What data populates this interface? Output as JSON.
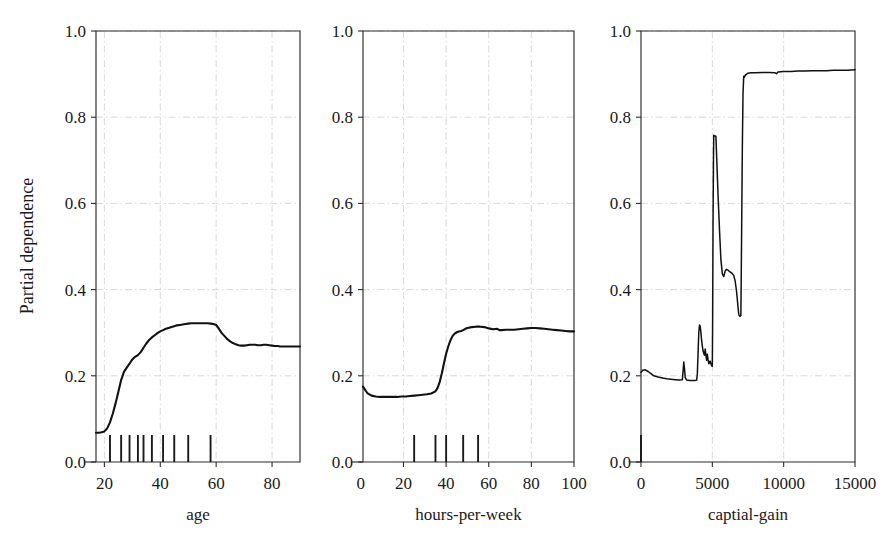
{
  "figure": {
    "ylabel": "Partial dependence",
    "background": "#ffffff",
    "line_color": "#111111",
    "grid_color": "#c8c8c8",
    "axis_color": "#2b2b2b"
  },
  "chart_data": [
    {
      "type": "line",
      "title": "",
      "xlabel": "age",
      "ylabel": "Partial dependence",
      "xlim": [
        17,
        90
      ],
      "ylim": [
        0.0,
        1.0
      ],
      "xticks": [
        20,
        40,
        60,
        80
      ],
      "yticks": [
        "0.0",
        "0.2",
        "0.4",
        "0.6",
        "0.8",
        "1.0"
      ],
      "ytick_values": [
        0.0,
        0.2,
        0.4,
        0.6,
        0.8,
        1.0
      ],
      "grid": true,
      "legend": "none",
      "rug_values": [
        22,
        26,
        29,
        32,
        34,
        37,
        41,
        45,
        50,
        58
      ],
      "x": [
        17,
        18,
        19,
        20,
        21,
        22,
        23,
        24,
        25,
        26,
        27,
        28,
        29,
        30,
        31,
        32,
        33,
        34,
        35,
        36,
        37,
        38,
        39,
        40,
        41,
        42,
        43,
        44,
        45,
        46,
        47,
        48,
        49,
        50,
        51,
        52,
        53,
        54,
        55,
        56,
        57,
        58,
        59,
        60,
        61,
        62,
        63,
        64,
        65,
        66,
        67,
        68,
        69,
        70,
        71,
        72,
        73,
        74,
        75,
        76,
        77,
        78,
        79,
        80,
        81,
        82,
        83,
        84,
        85,
        86,
        87,
        88,
        89,
        90
      ],
      "y": [
        0.068,
        0.068,
        0.069,
        0.071,
        0.078,
        0.092,
        0.112,
        0.136,
        0.163,
        0.19,
        0.209,
        0.219,
        0.228,
        0.238,
        0.244,
        0.248,
        0.255,
        0.265,
        0.275,
        0.283,
        0.289,
        0.294,
        0.299,
        0.303,
        0.306,
        0.309,
        0.311,
        0.313,
        0.315,
        0.317,
        0.318,
        0.319,
        0.32,
        0.321,
        0.322,
        0.322,
        0.322,
        0.322,
        0.322,
        0.322,
        0.322,
        0.321,
        0.32,
        0.318,
        0.309,
        0.299,
        0.292,
        0.285,
        0.28,
        0.276,
        0.273,
        0.271,
        0.27,
        0.27,
        0.271,
        0.272,
        0.272,
        0.272,
        0.271,
        0.271,
        0.272,
        0.272,
        0.271,
        0.27,
        0.269,
        0.269,
        0.268,
        0.268,
        0.268,
        0.268,
        0.268,
        0.268,
        0.268,
        0.268
      ]
    },
    {
      "type": "line",
      "title": "",
      "xlabel": "hours-per-week",
      "ylabel": "",
      "xlim": [
        1,
        100
      ],
      "ylim": [
        0.0,
        1.0
      ],
      "xticks": [
        0,
        20,
        40,
        60,
        80,
        100
      ],
      "yticks": [
        "0.0",
        "0.2",
        "0.4",
        "0.6",
        "0.8",
        "1.0"
      ],
      "ytick_values": [
        0.0,
        0.2,
        0.4,
        0.6,
        0.8,
        1.0
      ],
      "grid": true,
      "legend": "none",
      "rug_values": [
        25,
        35,
        40,
        48,
        55
      ],
      "x": [
        1,
        3,
        5,
        7,
        9,
        11,
        13,
        15,
        17,
        19,
        21,
        23,
        25,
        27,
        29,
        31,
        33,
        35,
        36,
        37,
        38,
        39,
        40,
        41,
        42,
        43,
        44,
        45,
        46,
        47,
        48,
        49,
        50,
        52,
        54,
        56,
        58,
        60,
        62,
        64,
        65,
        66,
        68,
        70,
        72,
        74,
        76,
        78,
        80,
        82,
        84,
        86,
        88,
        90,
        92,
        94,
        96,
        98,
        100
      ],
      "y": [
        0.175,
        0.16,
        0.154,
        0.152,
        0.151,
        0.151,
        0.151,
        0.151,
        0.151,
        0.152,
        0.152,
        0.153,
        0.154,
        0.155,
        0.156,
        0.157,
        0.159,
        0.164,
        0.172,
        0.186,
        0.206,
        0.229,
        0.251,
        0.268,
        0.282,
        0.292,
        0.298,
        0.301,
        0.303,
        0.304,
        0.306,
        0.309,
        0.311,
        0.313,
        0.314,
        0.314,
        0.313,
        0.31,
        0.308,
        0.309,
        0.306,
        0.306,
        0.307,
        0.307,
        0.307,
        0.308,
        0.309,
        0.31,
        0.311,
        0.311,
        0.31,
        0.309,
        0.308,
        0.307,
        0.306,
        0.305,
        0.304,
        0.303,
        0.303
      ]
    },
    {
      "type": "line",
      "title": "",
      "xlabel": "captial-gain",
      "ylabel": "",
      "xlim": [
        0,
        15000
      ],
      "ylim": [
        0.0,
        1.0
      ],
      "xticks": [
        0,
        5000,
        10000,
        15000
      ],
      "yticks": [
        "0.0",
        "0.2",
        "0.4",
        "0.6",
        "0.8",
        "1.0"
      ],
      "ytick_values": [
        0.0,
        0.2,
        0.4,
        0.6,
        0.8,
        1.0
      ],
      "grid": true,
      "legend": "none",
      "rug_values": [
        0
      ],
      "x": [
        0,
        120,
        300,
        500,
        700,
        900,
        1200,
        1500,
        1800,
        2100,
        2400,
        2700,
        2900,
        2960,
        3000,
        3050,
        3100,
        3200,
        3400,
        3600,
        3800,
        3900,
        3950,
        4000,
        4050,
        4100,
        4150,
        4200,
        4250,
        4300,
        4350,
        4400,
        4450,
        4500,
        4550,
        4600,
        4650,
        4700,
        4750,
        4800,
        4850,
        4900,
        4950,
        5000,
        5020,
        5050,
        5080,
        5100,
        5150,
        5250,
        5400,
        5500,
        5600,
        5700,
        5800,
        5900,
        6000,
        6100,
        6200,
        6300,
        6400,
        6500,
        6600,
        6700,
        6800,
        6850,
        6900,
        6950,
        7000,
        7050,
        7100,
        7150,
        7200,
        7250,
        7300,
        7400,
        7500,
        7700,
        8000,
        8500,
        9000,
        9400,
        9500,
        9600,
        10000,
        10500,
        11000,
        11500,
        12000,
        12500,
        13000,
        13500,
        14000,
        14500,
        15000
      ],
      "y": [
        0.208,
        0.213,
        0.214,
        0.21,
        0.205,
        0.2,
        0.197,
        0.195,
        0.193,
        0.192,
        0.191,
        0.19,
        0.191,
        0.215,
        0.232,
        0.216,
        0.196,
        0.19,
        0.189,
        0.189,
        0.189,
        0.19,
        0.205,
        0.252,
        0.3,
        0.318,
        0.315,
        0.3,
        0.282,
        0.268,
        0.258,
        0.252,
        0.248,
        0.262,
        0.248,
        0.236,
        0.25,
        0.238,
        0.228,
        0.23,
        0.234,
        0.228,
        0.224,
        0.222,
        0.32,
        0.56,
        0.7,
        0.758,
        0.757,
        0.756,
        0.62,
        0.54,
        0.47,
        0.437,
        0.43,
        0.443,
        0.447,
        0.445,
        0.442,
        0.44,
        0.437,
        0.433,
        0.42,
        0.395,
        0.36,
        0.343,
        0.339,
        0.338,
        0.34,
        0.52,
        0.72,
        0.855,
        0.895,
        0.893,
        0.897,
        0.9,
        0.902,
        0.903,
        0.903,
        0.904,
        0.904,
        0.903,
        0.901,
        0.905,
        0.906,
        0.906,
        0.907,
        0.907,
        0.908,
        0.908,
        0.908,
        0.909,
        0.909,
        0.909,
        0.91
      ]
    }
  ]
}
